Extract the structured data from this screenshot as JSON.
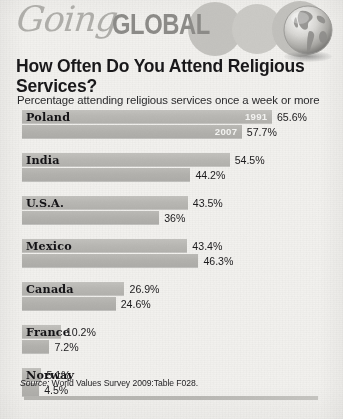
{
  "masthead": {
    "logo_script": "Going",
    "logo_bold": "GLOBAL",
    "globe_icon": "globe-americas-icon"
  },
  "title": "How Often Do You Attend Religious Services?",
  "subtitle": "Percentage attending religious services once a week or more",
  "source": {
    "label": "Source:",
    "text": " World Values Survey 2009:Table F028."
  },
  "chart_data": {
    "type": "bar",
    "orientation": "horizontal",
    "title": "How Often Do You Attend Religious Services?",
    "subtitle": "Percentage attending religious services once a week or more",
    "xlabel": "",
    "ylabel": "",
    "xlim": [
      0,
      70
    ],
    "grid": false,
    "legend_position": "inline-first-group",
    "categories": [
      "Poland",
      "India",
      "U.S.A.",
      "Mexico",
      "Canada",
      "France",
      "Norway"
    ],
    "series": [
      {
        "name": "1991",
        "values": [
          65.6,
          54.5,
          43.5,
          43.4,
          26.9,
          10.2,
          5.1
        ]
      },
      {
        "name": "2007",
        "values": [
          57.7,
          44.2,
          36.0,
          46.3,
          24.6,
          7.2,
          4.5
        ]
      }
    ],
    "value_labels": {
      "1991": [
        "65.6%",
        "54.5%",
        "43.5%",
        "43.4%",
        "26.9%",
        "10.2%",
        "5.1%"
      ],
      "2007": [
        "57.7%",
        "44.2%",
        "36%",
        "46.3%",
        "24.6%",
        "7.2%",
        "4.5%"
      ]
    },
    "source": "Source: World Values Survey 2009:Table F028."
  },
  "colors": {
    "bar_1991": "#bcbbb7",
    "bar_2007": "#b3b2ae",
    "page_background": "#f3f2ef",
    "text": "#19181a",
    "logo_gray": "#8d8c89"
  }
}
